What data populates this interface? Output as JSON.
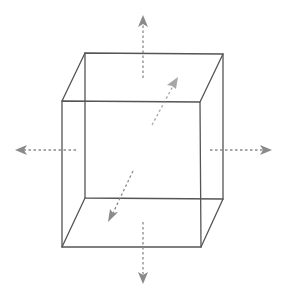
{
  "diagram": {
    "title": "",
    "colors": {
      "background": "#ffffff",
      "edge": "#555555",
      "arrow": "#8a8a8a"
    },
    "cube": {
      "vertices": {
        "back_top_left": [
          85,
          53
        ],
        "back_top_right": [
          223,
          54
        ],
        "back_bottom_left": [
          85,
          198
        ],
        "back_bottom_right": [
          223,
          199
        ],
        "front_top_left": [
          62,
          101
        ],
        "front_top_right": [
          200,
          102
        ],
        "front_bottom_left": [
          62,
          247
        ],
        "front_bottom_right": [
          201,
          247
        ]
      }
    },
    "arrows": [
      {
        "name": "up",
        "from": [
          143,
          78
        ],
        "to": [
          143,
          17
        ]
      },
      {
        "name": "down",
        "from": [
          143,
          222
        ],
        "to": [
          143,
          282
        ]
      },
      {
        "name": "left",
        "from": [
          76,
          150
        ],
        "to": [
          17,
          150
        ]
      },
      {
        "name": "right",
        "from": [
          210,
          150
        ],
        "to": [
          270,
          150
        ]
      },
      {
        "name": "back",
        "from": [
          152,
          125
        ],
        "to": [
          177,
          79
        ]
      },
      {
        "name": "front",
        "from": [
          133,
          171
        ],
        "to": [
          109,
          220
        ]
      }
    ]
  }
}
